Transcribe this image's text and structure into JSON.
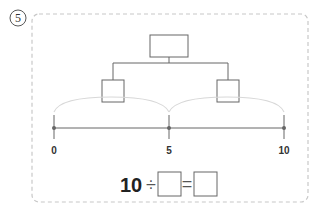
{
  "problem": {
    "number": "5",
    "number_style": "circled"
  },
  "tree": {
    "top_box": "",
    "left_box": "",
    "right_box": ""
  },
  "number_line": {
    "start": 0,
    "end": 10,
    "labels": [
      "0",
      "5",
      "10"
    ],
    "jumps": 2,
    "jump_size": 5
  },
  "equation": {
    "dividend": "10",
    "operator": "÷",
    "equals": "=",
    "divisor_box": "",
    "quotient_box": ""
  },
  "colors": {
    "border": "#c8c8c8",
    "line": "#666666",
    "arc": "#d8d8d8",
    "text": "#222222"
  }
}
